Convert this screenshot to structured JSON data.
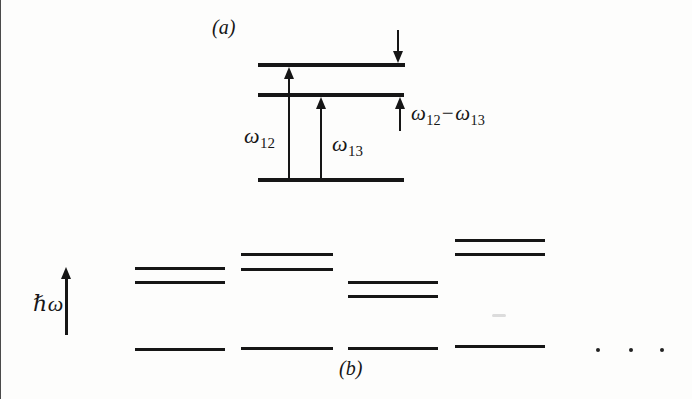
{
  "canvas": {
    "width": 692,
    "height": 399,
    "background": "#fdfdfc",
    "ink": "#161616"
  },
  "labels": {
    "panel_a": "(a)",
    "panel_b": "(b)",
    "omega12": {
      "base": "ω",
      "sub": "12"
    },
    "omega13": {
      "base": "ω",
      "sub": "13"
    },
    "difference": {
      "lhs_base": "ω",
      "lhs_sub": "12",
      "operator": "−",
      "rhs_base": "ω",
      "rhs_sub": "13"
    },
    "axis_label": "ℏω"
  },
  "panel_a": {
    "levels": [
      {
        "name": "upper-level-line",
        "x": 258,
        "y": 63,
        "w": 147,
        "t": 4
      },
      {
        "name": "middle-level-line",
        "x": 258,
        "y": 93,
        "w": 146,
        "t": 4
      },
      {
        "name": "ground-level-line",
        "x": 258,
        "y": 178,
        "w": 146,
        "t": 4
      }
    ],
    "arrows": [
      {
        "name": "omega12-transition-arrow",
        "dir": "up",
        "x": 289,
        "y1": 181,
        "y2": 67,
        "shaft": 2
      },
      {
        "name": "omega13-transition-arrow",
        "dir": "up",
        "x": 321,
        "y1": 181,
        "y2": 97,
        "shaft": 2
      },
      {
        "name": "splitting-top-arrow",
        "dir": "down",
        "x": 398,
        "y1": 30,
        "y2": 63,
        "shaft": 2
      },
      {
        "name": "splitting-bottom-arrow",
        "dir": "up",
        "x": 400,
        "y1": 131,
        "y2": 97,
        "shaft": 2
      }
    ]
  },
  "panel_b": {
    "axis_arrow": {
      "name": "energy-axis-arrow",
      "dir": "up",
      "x": 66,
      "y1": 335,
      "y2": 267,
      "shaft": 3
    },
    "line_thickness": 3,
    "groups": [
      {
        "x": 135,
        "w": 90,
        "upper": [
          267,
          281
        ],
        "ground": 348
      },
      {
        "x": 241,
        "w": 92,
        "upper": [
          253,
          268
        ],
        "ground": 347
      },
      {
        "x": 348,
        "w": 90,
        "upper": [
          281,
          295
        ],
        "ground": 347
      },
      {
        "x": 455,
        "w": 90,
        "upper": [
          239,
          253
        ],
        "ground": 345
      }
    ],
    "ellipsis_dots": [
      {
        "x": 598,
        "y": 350
      },
      {
        "x": 631,
        "y": 350
      },
      {
        "x": 662,
        "y": 350
      }
    ]
  }
}
